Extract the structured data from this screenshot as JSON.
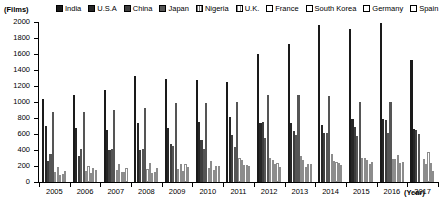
{
  "chart_data": {
    "type": "bar",
    "title": "",
    "xlabel": "(Year)",
    "ylabel": "(Films)",
    "ylim": [
      0,
      2000
    ],
    "ytick_step": 200,
    "yticks": [
      2000,
      1800,
      1600,
      1400,
      1200,
      1000,
      800,
      600,
      400,
      200,
      0
    ],
    "grid": false,
    "legend_position": "top",
    "categories": [
      "2005",
      "2006",
      "2007",
      "2008",
      "2009",
      "2010",
      "2011",
      "2012",
      "2013",
      "2014",
      "2015",
      "2016",
      "2017"
    ],
    "series": [
      {
        "name": "India",
        "color": "#1a1a1a",
        "pattern": "solid-dark",
        "values": [
          1041,
          1091,
          1146,
          1325,
          1288,
          1274,
          1255,
          1602,
          1724,
          1966,
          1907,
          1986,
          1530
        ]
      },
      {
        "name": "U.S.A",
        "color": "#262626",
        "pattern": "solid-dark",
        "values": [
          699,
          673,
          656,
          734,
          677,
          754,
          817,
          738,
          738,
          707,
          791,
          789,
          660
        ]
      },
      {
        "name": "China",
        "color": "#3d3d3d",
        "pattern": "solid-dark",
        "values": [
          260,
          330,
          402,
          406,
          475,
          526,
          584,
          745,
          638,
          618,
          686,
          772,
          650
        ]
      },
      {
        "name": "Japan",
        "color": "#555555",
        "pattern": "solid-mid",
        "values": [
          356,
          417,
          407,
          418,
          448,
          408,
          441,
          554,
          591,
          615,
          581,
          610,
          594
        ]
      },
      {
        "name": "Nigeria",
        "color": "#777777",
        "pattern": "hatch",
        "values": [
          872,
          872,
          900,
          920,
          987,
          988,
          997,
          1091,
          1090,
          1074,
          997,
          997,
          0
        ]
      },
      {
        "name": "U.K.",
        "color": "#969696",
        "pattern": "hatch-light",
        "values": [
          124,
          134,
          148,
          165,
          167,
          180,
          299,
          300,
          324,
          353,
          300,
          285,
          285
        ]
      },
      {
        "name": "France",
        "color": "#b4b4b4",
        "pattern": "open",
        "values": [
          187,
          203,
          228,
          240,
          230,
          261,
          272,
          279,
          270,
          258,
          300,
          283,
          222
        ]
      },
      {
        "name": "South Korea",
        "color": "#c8c8c8",
        "pattern": "open",
        "values": [
          83,
          110,
          124,
          113,
          138,
          152,
          216,
          229,
          183,
          248,
          269,
          339,
          376
        ]
      },
      {
        "name": "Germany",
        "color": "#dcdcdc",
        "pattern": "open",
        "values": [
          103,
          174,
          125,
          125,
          220,
          200,
          212,
          241,
          220,
          233,
          226,
          236,
          233
        ]
      },
      {
        "name": "Spain",
        "color": "#f0f0f0",
        "pattern": "open",
        "values": [
          142,
          150,
          172,
          173,
          186,
          201,
          199,
          182,
          231,
          216,
          255,
          254,
          141
        ]
      }
    ]
  },
  "axis": {
    "unit_label": "(Films)",
    "year_label": "(Year)"
  }
}
